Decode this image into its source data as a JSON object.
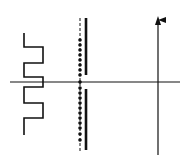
{
  "diagram": {
    "type": "physics-schematic",
    "background": "#ffffff",
    "stroke_color": "#111111",
    "elements": {
      "square_wave": {
        "label": "square-wave conductor",
        "points": "24,33 24,47 43,47 43,63 24,63 24,77 43,77 43,87 24,87 24,103 43,103 43,118 24,118 24,135"
      },
      "horizontal_axis": {
        "x1": 10,
        "y1": 82,
        "x2": 180,
        "y2": 82
      },
      "dashed_line": {
        "x": 80,
        "y1": 18,
        "y2": 152
      },
      "thick_plate_top": {
        "x": 86,
        "y1": 18,
        "y2": 75
      },
      "thick_plate_bottom": {
        "x": 86,
        "y1": 89,
        "y2": 150
      },
      "vertical_arrow": {
        "x": 158,
        "y1": 18,
        "y2": 155
      }
    }
  }
}
